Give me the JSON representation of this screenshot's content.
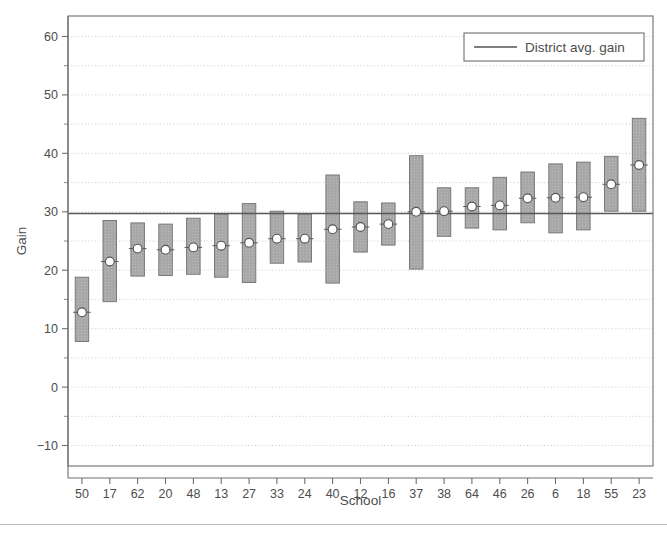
{
  "chart_data": {
    "type": "bar",
    "title": "",
    "subtitle": "",
    "xlabel": "School",
    "ylabel": "Gain",
    "ylim": [
      -13.5,
      63.5
    ],
    "ytick_values": [
      -10,
      0,
      10,
      20,
      30,
      40,
      50,
      60
    ],
    "ytick_labels": [
      "−10",
      "0",
      "10",
      "20",
      "30",
      "40",
      "50",
      "60"
    ],
    "yminor_values": [
      -5,
      5,
      15,
      25,
      35,
      45,
      55
    ],
    "grid": "horizontal-dotted",
    "legend_position": "top-right",
    "legend": [
      {
        "label": "District avg. gain",
        "marker": "line",
        "color": "#555555"
      }
    ],
    "reference_line": {
      "label": "District avg. gain",
      "value": 29.7
    },
    "categories": [
      "50",
      "17",
      "62",
      "20",
      "48",
      "13",
      "27",
      "33",
      "24",
      "40",
      "12",
      "16",
      "37",
      "38",
      "64",
      "46",
      "26",
      "6",
      "18",
      "55",
      "23"
    ],
    "series": [
      {
        "name": "Interval (low to high)",
        "type": "range-bar",
        "fill": "#a8a8a8",
        "edge": "#707070",
        "low": [
          7.8,
          14.6,
          19.0,
          19.1,
          19.3,
          18.8,
          17.9,
          21.2,
          21.4,
          17.8,
          23.1,
          24.3,
          20.2,
          25.8,
          27.2,
          26.9,
          28.1,
          26.4,
          26.9,
          30.1,
          30.1
        ],
        "high": [
          18.8,
          28.5,
          28.1,
          27.9,
          28.9,
          29.6,
          31.4,
          30.1,
          29.6,
          36.3,
          31.7,
          31.5,
          39.6,
          34.1,
          34.1,
          35.9,
          36.8,
          38.2,
          38.5,
          39.5,
          46.0
        ]
      },
      {
        "name": "School avg. gain",
        "type": "point",
        "marker": "circle",
        "fill": "#ffffff",
        "edge": "#555555",
        "values": [
          12.8,
          21.5,
          23.7,
          23.5,
          23.9,
          24.2,
          24.7,
          25.4,
          25.4,
          27.0,
          27.4,
          27.9,
          30.0,
          30.1,
          30.9,
          31.1,
          32.3,
          32.4,
          32.5,
          34.7,
          38.0
        ]
      }
    ]
  },
  "axes": {
    "x_title": "School",
    "y_title": "Gain"
  }
}
